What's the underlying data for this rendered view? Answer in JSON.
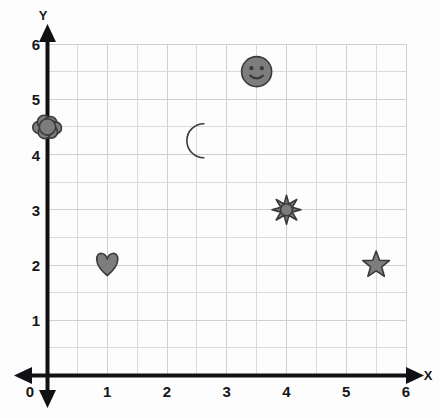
{
  "chart_data": {
    "type": "scatter",
    "title": "",
    "xlabel": "X",
    "ylabel": "Y",
    "xlim": [
      0,
      6
    ],
    "ylim": [
      0,
      6
    ],
    "grid": true,
    "grid_step": 0.5,
    "legend": "none",
    "x_ticks": [
      "0",
      "1",
      "2",
      "3",
      "4",
      "5",
      "6"
    ],
    "y_ticks": [
      "1",
      "2",
      "3",
      "4",
      "5",
      "6"
    ],
    "x_tick_values": [
      0,
      1,
      2,
      3,
      4,
      5,
      6
    ],
    "y_tick_values": [
      1,
      2,
      3,
      4,
      5,
      6
    ],
    "origin_label": "0",
    "marker_color": "#7d7d7d",
    "marker_outline_color": "#3a3a3a",
    "axis_color": "#111115",
    "grid_color": "#d9d9de",
    "background_color": "#fdfdfd",
    "points": [
      {
        "name": "cloud",
        "icon": "cloud-icon",
        "x": 0,
        "y": 4.5
      },
      {
        "name": "smiley",
        "icon": "smiley-icon",
        "x": 3.5,
        "y": 5.5
      },
      {
        "name": "moon",
        "icon": "moon-icon",
        "x": 2.5,
        "y": 4.25
      },
      {
        "name": "sun",
        "icon": "sun-icon",
        "x": 4,
        "y": 3
      },
      {
        "name": "heart",
        "icon": "heart-icon",
        "x": 1,
        "y": 2
      },
      {
        "name": "star",
        "icon": "star-icon",
        "x": 5.5,
        "y": 2
      }
    ]
  },
  "axes": {
    "x_title": "X",
    "y_title": "Y",
    "origin": "0"
  },
  "ticks": {
    "x": [
      "1",
      "2",
      "3",
      "4",
      "5",
      "6"
    ],
    "y": [
      "1",
      "2",
      "3",
      "4",
      "5",
      "6"
    ]
  }
}
